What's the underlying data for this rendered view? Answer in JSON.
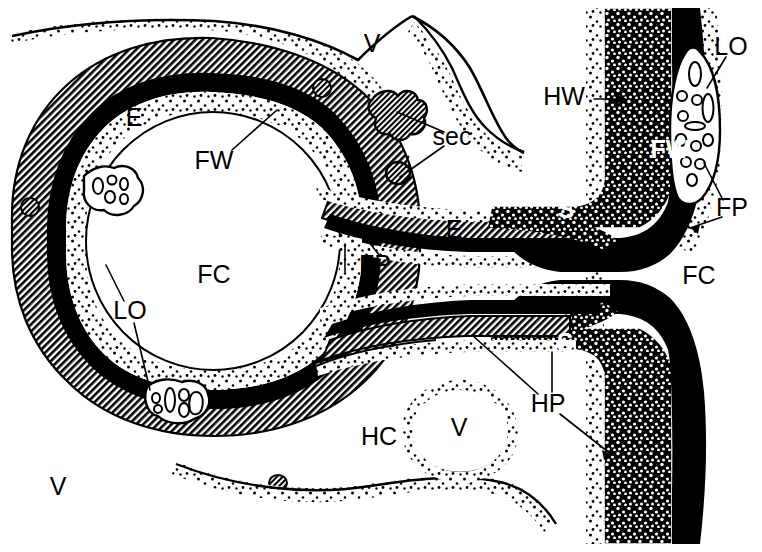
{
  "figure": {
    "kind": "histological-schematic",
    "caption": "",
    "width": 762,
    "height": 552,
    "background_color": "#ffffff",
    "ink_color": "#000000"
  },
  "labels": [
    {
      "id": "v-top",
      "text": "V",
      "x": 372,
      "y": 45,
      "size": 26,
      "style": "plain",
      "name": "label-v-top"
    },
    {
      "id": "e-left",
      "text": "E",
      "x": 134,
      "y": 119,
      "size": 25,
      "style": "plain",
      "name": "label-e-left"
    },
    {
      "id": "fw-left",
      "text": "FW",
      "x": 214,
      "y": 162,
      "size": 26,
      "style": "plain",
      "name": "label-fw-left"
    },
    {
      "id": "sec",
      "text": "sec",
      "x": 452,
      "y": 138,
      "size": 25,
      "style": "plain",
      "name": "label-sec"
    },
    {
      "id": "hw",
      "text": "HW",
      "x": 564,
      "y": 98,
      "size": 26,
      "style": "plain",
      "name": "label-hw"
    },
    {
      "id": "lo-topright",
      "text": "LO",
      "x": 731,
      "y": 48,
      "size": 26,
      "style": "plain",
      "name": "label-lo-top-right"
    },
    {
      "id": "fw-right",
      "text": "FW",
      "x": 670,
      "y": 151,
      "size": 26,
      "style": "bold-white",
      "name": "label-fw-right"
    },
    {
      "id": "fp-right",
      "text": "FP",
      "x": 732,
      "y": 209,
      "size": 26,
      "style": "plain",
      "name": "label-fp-right"
    },
    {
      "id": "s-upper",
      "text": "S",
      "x": 566,
      "y": 211,
      "size": 25,
      "style": "bold-white",
      "name": "label-s-upper"
    },
    {
      "id": "e-mid",
      "text": "E",
      "x": 454,
      "y": 231,
      "size": 25,
      "style": "plain",
      "name": "label-e-mid"
    },
    {
      "id": "fp-left",
      "text": "FP",
      "x": 375,
      "y": 266,
      "size": 26,
      "style": "plain",
      "name": "label-fp-left"
    },
    {
      "id": "fc-left",
      "text": "FC",
      "x": 214,
      "y": 276,
      "size": 26,
      "style": "plain",
      "name": "label-fc-left"
    },
    {
      "id": "fc-right",
      "text": "FC",
      "x": 699,
      "y": 277,
      "size": 26,
      "style": "plain",
      "name": "label-fc-right"
    },
    {
      "id": "lo-left",
      "text": "LO",
      "x": 130,
      "y": 312,
      "size": 26,
      "style": "plain",
      "name": "label-lo-left"
    },
    {
      "id": "s-lower",
      "text": "S",
      "x": 565,
      "y": 344,
      "size": 25,
      "style": "bold-white",
      "name": "label-s-lower"
    },
    {
      "id": "hp",
      "text": "HP",
      "x": 548,
      "y": 405,
      "size": 26,
      "style": "plain",
      "name": "label-hp"
    },
    {
      "id": "v-vesicle",
      "text": "V",
      "x": 459,
      "y": 429,
      "size": 26,
      "style": "plain",
      "name": "label-v-vesicle"
    },
    {
      "id": "hc",
      "text": "HC",
      "x": 379,
      "y": 438,
      "size": 26,
      "style": "plain",
      "name": "label-hc"
    },
    {
      "id": "v-bottom",
      "text": "V",
      "x": 58,
      "y": 488,
      "size": 26,
      "style": "plain",
      "name": "label-v-bottom"
    }
  ],
  "legend_keys": [
    {
      "abbr": "V",
      "meaning": "V"
    },
    {
      "abbr": "E",
      "meaning": "E"
    },
    {
      "abbr": "FW",
      "meaning": "FW"
    },
    {
      "abbr": "FC",
      "meaning": "FC"
    },
    {
      "abbr": "FP",
      "meaning": "FP"
    },
    {
      "abbr": "LO",
      "meaning": "LO"
    },
    {
      "abbr": "HW",
      "meaning": "HW"
    },
    {
      "abbr": "HC",
      "meaning": "HC"
    },
    {
      "abbr": "HP",
      "meaning": "HP"
    },
    {
      "abbr": "S",
      "meaning": "S"
    },
    {
      "abbr": "sec",
      "meaning": "sec"
    }
  ],
  "leaders": [
    {
      "name": "leader-fw-left",
      "d": "M 232 150 L 277 110"
    },
    {
      "name": "leader-sec-upper",
      "d": "M 444 132 L 397 112"
    },
    {
      "name": "leader-sec-lower",
      "d": "M 444 146 L 400 177"
    },
    {
      "name": "leader-hw-arrow",
      "d": "M 594 99 L 626 99"
    },
    {
      "name": "leader-lo-topright",
      "d": "M 726 57 L 707 88"
    },
    {
      "name": "leader-fp-right-a",
      "d": "M 723 200 L 704 163"
    },
    {
      "name": "leader-fp-right-b",
      "d": "M 722 217 L 690 228"
    },
    {
      "name": "leader-fp-left",
      "d": "M 380 256 L 356 226"
    },
    {
      "name": "leader-e-mid-tick",
      "d": "M 345 244 L 345 272"
    },
    {
      "name": "leader-lo-left-up",
      "d": "M 124 301 L 106 265"
    },
    {
      "name": "leader-lo-left-dn",
      "d": "M 134 323 L 150 390"
    },
    {
      "name": "leader-hp-a",
      "d": "M 538 394 L 472 335"
    },
    {
      "name": "leader-hp-b",
      "d": "M 552 392 L 552 352"
    },
    {
      "name": "leader-hp-c",
      "d": "M 560 414 L 612 455"
    }
  ],
  "structures": [
    {
      "name": "follicle-outer-vitelline-layer",
      "fill_style": "stipple"
    },
    {
      "name": "follicle-wall-hatched-band",
      "fill_style": "diagonal-hatch"
    },
    {
      "name": "follicle-wall-dense-black-band",
      "fill_style": "solid-black"
    },
    {
      "name": "follicle-cavity",
      "fill_style": "white"
    },
    {
      "name": "haustorial-wall-stippled-column",
      "fill_style": "dense-stipple"
    },
    {
      "name": "haustorial-wall-black-column",
      "fill_style": "solid-black"
    },
    {
      "name": "lipid-organelle-cluster",
      "fill_style": "white-vesicles"
    },
    {
      "name": "secretory-body",
      "fill_style": "diagonal-hatch"
    },
    {
      "name": "vacuole",
      "fill_style": "white"
    }
  ]
}
